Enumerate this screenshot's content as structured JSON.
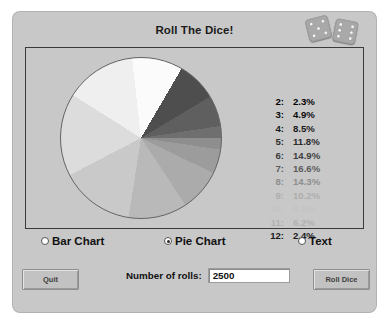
{
  "window": {
    "title": "Roll The Dice!",
    "background_color": "#c8c8c8"
  },
  "dice": {
    "left_die_name": "die-icon-left",
    "right_die_name": "die-icon-right",
    "left_die_face": 5,
    "right_die_face": 6
  },
  "chart_data": {
    "type": "pie",
    "title": "Roll The Dice!",
    "categories": [
      "2",
      "3",
      "4",
      "5",
      "6",
      "7",
      "8",
      "9",
      "10",
      "11",
      "12"
    ],
    "values": [
      2.3,
      4.9,
      8.5,
      11.8,
      14.9,
      16.6,
      14.3,
      10.2,
      8.0,
      6.2,
      2.4
    ],
    "unit": "%",
    "legend_position": "right",
    "start_angle_deg": 0,
    "direction": "clockwise",
    "slice_colors": [
      "#8e8e8e",
      "#9c9c9c",
      "#ababab",
      "#b9b9b9",
      "#c9c9c9",
      "#dcdcdc",
      "#efefef",
      "#fbfbfb",
      "#4e4e4e",
      "#5f5f5f",
      "#6f6f6f"
    ],
    "legend_text_colors": [
      "#000000",
      "#0a0a0a",
      "#191919",
      "#2a2a2a",
      "#3d3d3d",
      "#5c5c5c",
      "#8e8e8e",
      "#aeaeae",
      "#c4c4c4",
      "#b0b0b0",
      "#1a1a1a"
    ],
    "legend_rows": [
      {
        "key": "2:",
        "value": "2.3%"
      },
      {
        "key": "3:",
        "value": "4.9%"
      },
      {
        "key": "4:",
        "value": "8.5%"
      },
      {
        "key": "5:",
        "value": "11.8%"
      },
      {
        "key": "6:",
        "value": "14.9%"
      },
      {
        "key": "7:",
        "value": "16.6%"
      },
      {
        "key": "8:",
        "value": "14.3%"
      },
      {
        "key": "9:",
        "value": "10.2%"
      },
      {
        "key": "10:",
        "value": "8.0%"
      },
      {
        "key": "11:",
        "value": "6.2%"
      },
      {
        "key": "12:",
        "value": "2.4%"
      }
    ]
  },
  "view_options": {
    "bar_chart_label": "Bar Chart",
    "pie_chart_label": "Pie Chart",
    "text_label": "Text",
    "selected": "Pie Chart"
  },
  "controls": {
    "quit_label": "Quit",
    "roll_dice_label": "Roll Dice",
    "rolls_label": "Number of rolls:",
    "rolls_value": "2500",
    "rolls_placeholder": "2500"
  }
}
